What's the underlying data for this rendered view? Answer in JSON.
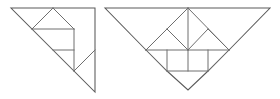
{
  "figure": {
    "background_color": "#ffffff",
    "line_color": "#6e6e6e",
    "outline_color": "#5a5a5a",
    "line_width": 1,
    "width": 280,
    "height": 99,
    "shapes": [
      {
        "name": "left-triangle-figure",
        "label": "Right triangle tangram arrangement",
        "outline": "11,8 95,8 95,92",
        "internal_lines": [
          "53,8 32,29",
          "53,8 74,29",
          "32,29 74,29",
          "32,29 53,50",
          "74,29 74,71",
          "53,50 74,50",
          "53,50 74,71",
          "74,71 95,50"
        ]
      },
      {
        "name": "right-bat-figure",
        "label": "Symmetric bat-shaped tangram arrangement",
        "outline": "105,8 270,8 229,50 208,71 188,90 167,71 146,50",
        "internal_lines": [
          "188,8 146,50",
          "188,8 229,50",
          "188,8 188,71",
          "146,50 167,29",
          "229,50 208,29",
          "146,50 188,50",
          "188,50 229,50",
          "146,50 167,71",
          "229,50 208,71",
          "167,29 188,50",
          "208,29 188,50",
          "167,50 167,71",
          "208,50 208,71",
          "167,71 208,71"
        ]
      }
    ]
  }
}
